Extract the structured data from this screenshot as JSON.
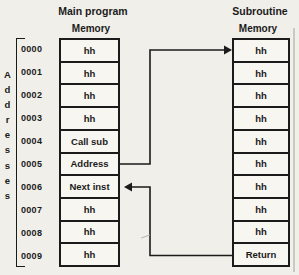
{
  "colors": {
    "background": "#f1efe9",
    "ink": "#1b1b1b",
    "cell_fill": "#f8f6f0",
    "scan_edge": "#ccc9c2"
  },
  "address_panel": {
    "vertical_label": "Addresses",
    "labels": [
      "0000",
      "0001",
      "0002",
      "0003",
      "0004",
      "0005",
      "0006",
      "0007",
      "0008",
      "0009"
    ]
  },
  "main_program": {
    "title": "Main program",
    "memory_label": "Memory",
    "cells": [
      "hh",
      "hh",
      "hh",
      "hh",
      "Call sub",
      "Address",
      "Next inst",
      "hh",
      "hh",
      "hh"
    ]
  },
  "subroutine": {
    "title": "Subroutine",
    "memory_label": "Memory",
    "cells": [
      "hh",
      "hh",
      "hh",
      "hh",
      "hh",
      "hh",
      "hh",
      "hh",
      "hh",
      "Return"
    ]
  },
  "arrows": {
    "call": {
      "from_cell": "Address",
      "to_cell": "hh (subroutine start)"
    },
    "return": {
      "from_cell": "Return",
      "to_cell": "Next inst"
    }
  }
}
